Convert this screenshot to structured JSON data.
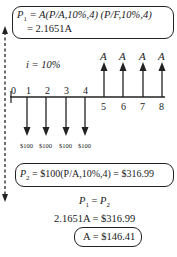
{
  "diagram": {
    "type": "cash-flow-diagram",
    "interest_label": "i = 10%",
    "interest_rate": "10%",
    "timeline": {
      "periods": [
        "0",
        "1",
        "2",
        "3",
        "4",
        "5",
        "6",
        "7",
        "8"
      ],
      "outflows": [
        {
          "period": "1",
          "label": "$100"
        },
        {
          "period": "2",
          "label": "$100"
        },
        {
          "period": "3",
          "label": "$100"
        },
        {
          "period": "4",
          "label": "$100"
        }
      ],
      "inflows": [
        {
          "period": "5",
          "label": "A"
        },
        {
          "period": "6",
          "label": "A"
        },
        {
          "period": "7",
          "label": "A"
        },
        {
          "period": "8",
          "label": "A"
        }
      ]
    },
    "top_box": {
      "line1_lhs": "P",
      "line1_sub": "1",
      "line1_rhs": " = A(P/A,10%,4) (P/F,10%,4)",
      "line2": "= 2.1651A"
    },
    "bottom_box": {
      "lhs": "P",
      "sub": "2",
      "rhs": " = $100(P/A,10%,4) = $316.99"
    },
    "equations": {
      "eq1_a": "P",
      "eq1_a_sub": "1",
      "eq1_mid": " = ",
      "eq1_b": "P",
      "eq1_b_sub": "2",
      "eq2": "2.1651A = $316.99",
      "result": "A = $146.41"
    },
    "colors": {
      "line": "#222222",
      "background": "#ffffff"
    }
  }
}
